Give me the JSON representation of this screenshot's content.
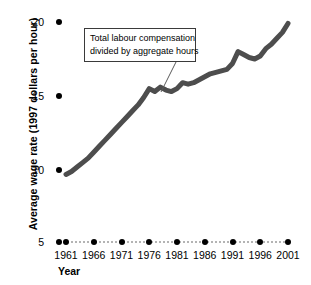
{
  "chart_data": {
    "type": "line",
    "title": "",
    "subtitle": "",
    "xlabel": "Year",
    "ylabel": "Average wage rate (1997 dollars per hour)",
    "xlim": [
      1961,
      2001
    ],
    "ylim": [
      5,
      20
    ],
    "yticks": [
      5,
      10,
      15,
      20
    ],
    "ytick_labels": [
      "5",
      "10",
      "15",
      "20"
    ],
    "xticks": [
      1961,
      1966,
      1971,
      1976,
      1981,
      1986,
      1991,
      1996,
      2001
    ],
    "xtick_labels": [
      "1961",
      "1966",
      "1971",
      "1976",
      "1981",
      "1986",
      "1991",
      "1996",
      "2001"
    ],
    "grid": false,
    "legend": "none",
    "axis_break_note": "y-axis compressed between 5 and 10",
    "line_color": "#4d4d4d",
    "line_width_px": 5,
    "annotations": [
      {
        "name": "series-callout",
        "lines": [
          "Total labour compensation",
          "divided by aggregate hours"
        ],
        "box": {
          "x": 84,
          "y": 28,
          "width": 112,
          "height": 34
        },
        "leader_from": {
          "x": 176,
          "y": 62
        },
        "leader_to": {
          "x": 161,
          "y": 92
        }
      }
    ],
    "series": [
      {
        "name": "Average wage rate",
        "x": [
          1961,
          1962,
          1963,
          1964,
          1965,
          1966,
          1967,
          1968,
          1969,
          1970,
          1971,
          1972,
          1973,
          1974,
          1975,
          1976,
          1977,
          1978,
          1979,
          1980,
          1981,
          1982,
          1983,
          1984,
          1985,
          1986,
          1987,
          1988,
          1989,
          1990,
          1991,
          1992,
          1993,
          1994,
          1995,
          1996,
          1997,
          1998,
          1999,
          2000,
          2001
        ],
        "values": [
          9.7,
          9.9,
          10.2,
          10.5,
          10.8,
          11.2,
          11.6,
          12.0,
          12.4,
          12.8,
          13.2,
          13.6,
          14.0,
          14.4,
          14.9,
          15.5,
          15.3,
          15.6,
          15.4,
          15.3,
          15.5,
          15.9,
          15.8,
          15.9,
          16.1,
          16.3,
          16.5,
          16.6,
          16.7,
          16.8,
          17.2,
          18.0,
          17.8,
          17.6,
          17.5,
          17.7,
          18.2,
          18.5,
          18.9,
          19.3,
          19.9
        ]
      }
    ]
  },
  "axis": {
    "y_title": "Average wage rate (1997 dollars per hour)",
    "x_title": "Year"
  }
}
